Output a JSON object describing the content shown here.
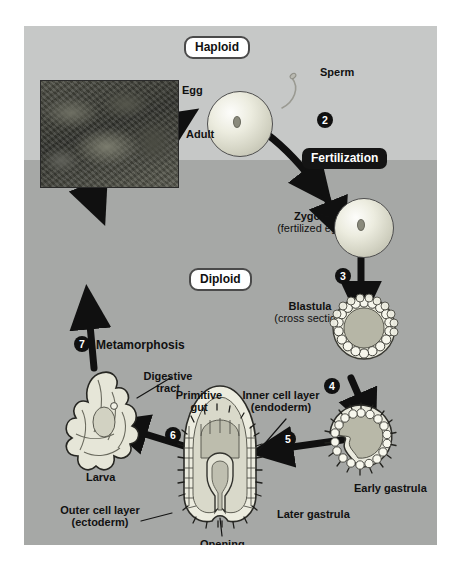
{
  "figure": {
    "bands": [
      {
        "name": "haploid",
        "label": "Haploid",
        "color": "#c6c8c7"
      },
      {
        "name": "diploid",
        "label": "Diploid",
        "color": "#a6a8a6"
      }
    ],
    "ploidy_labels": {
      "haploid": "Haploid",
      "diploid": "Diploid"
    },
    "process_chips": [
      {
        "id": "meiosis",
        "label": "Meiosis"
      },
      {
        "id": "fertilization",
        "label": "Fertilization"
      }
    ],
    "steps": [
      {
        "number": "1",
        "process": "Meiosis"
      },
      {
        "number": "2",
        "process": "Fertilization"
      },
      {
        "number": "3",
        "process": ""
      },
      {
        "number": "4",
        "process": ""
      },
      {
        "number": "5",
        "process": ""
      },
      {
        "number": "6",
        "process": ""
      },
      {
        "number": "7",
        "process": "Metamorphosis"
      }
    ],
    "stages": [
      {
        "id": "egg",
        "label": "Egg",
        "sublabel": ""
      },
      {
        "id": "sperm",
        "label": "Sperm",
        "sublabel": ""
      },
      {
        "id": "zygote",
        "label": "Zygote",
        "sublabel": "(fertilized egg)"
      },
      {
        "id": "blastula",
        "label": "Blastula",
        "sublabel": "(cross section)"
      },
      {
        "id": "early-gastrula",
        "label": "Early gastrula",
        "sublabel": ""
      },
      {
        "id": "later-gastrula",
        "label": "Later gastrula",
        "sublabel": ""
      },
      {
        "id": "larva",
        "label": "Larva",
        "sublabel": ""
      },
      {
        "id": "adult",
        "label": "Adult",
        "sublabel": ""
      }
    ],
    "process_step_labels": [
      {
        "number": "7",
        "label": "Metamorphosis"
      }
    ],
    "annotations": [
      {
        "id": "digestive-tract",
        "line1": "Digestive",
        "line2": "tract"
      },
      {
        "id": "primitive-gut",
        "line1": "Primitive",
        "line2": "gut"
      },
      {
        "id": "inner-cell-layer",
        "line1": "Inner cell layer",
        "line2": "(endoderm)"
      },
      {
        "id": "outer-cell-layer",
        "line1": "Outer cell layer",
        "line2": "(ectoderm)"
      },
      {
        "id": "opening",
        "line1": "Opening",
        "line2": ""
      }
    ]
  }
}
